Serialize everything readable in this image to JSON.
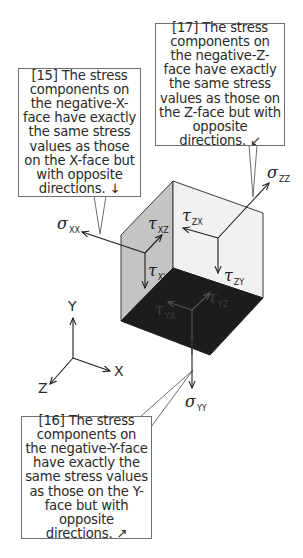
{
  "callouts": [
    {
      "id": "15",
      "text": "[15] The stress components on the negative-X-face have exactly the same stress values as those on the X-face but with opposite directions. ↓"
    },
    {
      "id": "17",
      "text": "[17] The stress components on the negative-Z-face have exactly the same stress values as those on the Z-face but with opposite directions. ↙"
    },
    {
      "id": "16",
      "text": "[16] The stress components on the negative-Y-face have exactly the same stress values as those on the Y-face but with opposite directions. ↗"
    }
  ],
  "stress_labels": {
    "sigma_xx": {
      "symbol": "σ",
      "sub": "XX"
    },
    "sigma_zz": {
      "symbol": "σ",
      "sub": "ZZ"
    },
    "sigma_yy": {
      "symbol": "σ",
      "sub": "YY"
    },
    "tau_xz": {
      "symbol": "τ",
      "sub": "XZ"
    },
    "tau_xy": {
      "symbol": "τ",
      "sub": "XY"
    },
    "tau_zx": {
      "symbol": "τ",
      "sub": "ZX"
    },
    "tau_zy": {
      "symbol": "τ",
      "sub": "ZY"
    },
    "tau_yx": {
      "symbol": "τ",
      "sub": "YX"
    },
    "tau_yz": {
      "symbol": "τ",
      "sub": "YZ"
    }
  },
  "axes": {
    "x": "X",
    "y": "Y",
    "z": "Z"
  },
  "colors": {
    "x_face": "#c4c4c4",
    "z_face": "#f1f1f1",
    "y_face": "#1c1c1c",
    "edge": "#3a3a3a",
    "callout_border": "#6f6f6f"
  }
}
